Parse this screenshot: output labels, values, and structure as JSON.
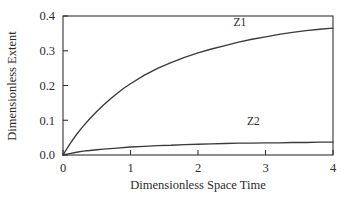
{
  "chart_data": {
    "type": "line",
    "title": "",
    "subtitle": "",
    "xlabel": "Dimensionless Space Time",
    "ylabel": "Dimensionless Extent",
    "xlim": [
      0,
      4
    ],
    "ylim": [
      0.0,
      0.4
    ],
    "xticks": [
      0,
      1,
      2,
      3,
      4
    ],
    "xticklabels": [
      "0",
      "1",
      "2",
      "3",
      "4"
    ],
    "yticks": [
      0.0,
      0.1,
      0.2,
      0.3,
      0.4
    ],
    "yticklabels": [
      "0.0",
      "0.1",
      "0.2",
      "0.3",
      "0.4"
    ],
    "grid": false,
    "legend": "inline-annotations",
    "line_color": "#3a3a3a",
    "frame_color": "#333333",
    "background_color": "#ffffff",
    "annotations": [
      {
        "text": "Z1",
        "x": 2.62,
        "y": 0.372
      },
      {
        "text": "Z2",
        "x": 2.82,
        "y": 0.086
      }
    ],
    "series": [
      {
        "name": "Z1",
        "x": [
          0.0,
          0.1,
          0.2,
          0.3,
          0.4,
          0.5,
          0.6,
          0.7,
          0.8,
          0.9,
          1.0,
          1.2,
          1.4,
          1.6,
          1.8,
          2.0,
          2.2,
          2.4,
          2.6,
          2.8,
          3.0,
          3.2,
          3.4,
          3.6,
          3.8,
          4.0
        ],
        "y": [
          0.0,
          0.031,
          0.059,
          0.083,
          0.105,
          0.125,
          0.144,
          0.161,
          0.177,
          0.192,
          0.205,
          0.229,
          0.249,
          0.266,
          0.281,
          0.294,
          0.305,
          0.315,
          0.325,
          0.333,
          0.34,
          0.347,
          0.353,
          0.358,
          0.362,
          0.365
        ]
      },
      {
        "name": "Z2",
        "x": [
          0.0,
          0.1,
          0.2,
          0.3,
          0.4,
          0.5,
          0.6,
          0.8,
          1.0,
          1.2,
          1.4,
          1.6,
          1.8,
          2.0,
          2.2,
          2.4,
          2.6,
          2.8,
          3.0,
          3.2,
          3.4,
          3.6,
          3.8,
          4.0
        ],
        "y": [
          0.0,
          0.004,
          0.008,
          0.011,
          0.013,
          0.015,
          0.017,
          0.02,
          0.023,
          0.025,
          0.027,
          0.028,
          0.03,
          0.031,
          0.032,
          0.033,
          0.034,
          0.034,
          0.035,
          0.035,
          0.036,
          0.036,
          0.037,
          0.037
        ]
      }
    ]
  }
}
